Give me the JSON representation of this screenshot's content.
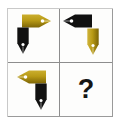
{
  "puzzle": {
    "type": "visual-analogy-matrix",
    "grid": {
      "rows": 2,
      "columns": 2
    },
    "colors": {
      "gold": "#b89a16",
      "gold_shade": "#8e7309",
      "black": "#111111",
      "border": "#8d8d8d",
      "frame": "#9a9a9a",
      "background": "#fdfdfc",
      "page_background": "#ffffff",
      "hole": "#ffffff"
    },
    "cells": [
      {
        "id": "cell-top-left",
        "position": "top-left",
        "answer": false,
        "objects": [
          {
            "name": "gold-nib-right",
            "shape": "pen-nib",
            "color": "gold",
            "orientation": "right",
            "placement": "upper-right"
          },
          {
            "name": "black-nib-down",
            "shape": "pen-nib",
            "color": "black",
            "orientation": "down",
            "placement": "lower-left"
          }
        ]
      },
      {
        "id": "cell-top-right",
        "position": "top-right",
        "answer": false,
        "objects": [
          {
            "name": "black-nib-left",
            "shape": "pen-nib",
            "color": "black",
            "orientation": "left",
            "placement": "upper-left"
          },
          {
            "name": "gold-nib-down",
            "shape": "pen-nib",
            "color": "gold",
            "orientation": "down",
            "placement": "lower-right"
          }
        ]
      },
      {
        "id": "cell-bottom-left",
        "position": "bottom-left",
        "answer": false,
        "objects": [
          {
            "name": "gold-nib-left",
            "shape": "pen-nib",
            "color": "gold",
            "orientation": "left",
            "placement": "upper-left"
          },
          {
            "name": "black-nib-down",
            "shape": "pen-nib",
            "color": "black",
            "orientation": "down",
            "placement": "lower-right"
          }
        ]
      },
      {
        "id": "cell-bottom-right",
        "position": "bottom-right",
        "answer": true,
        "label": "?",
        "objects": []
      }
    ]
  }
}
